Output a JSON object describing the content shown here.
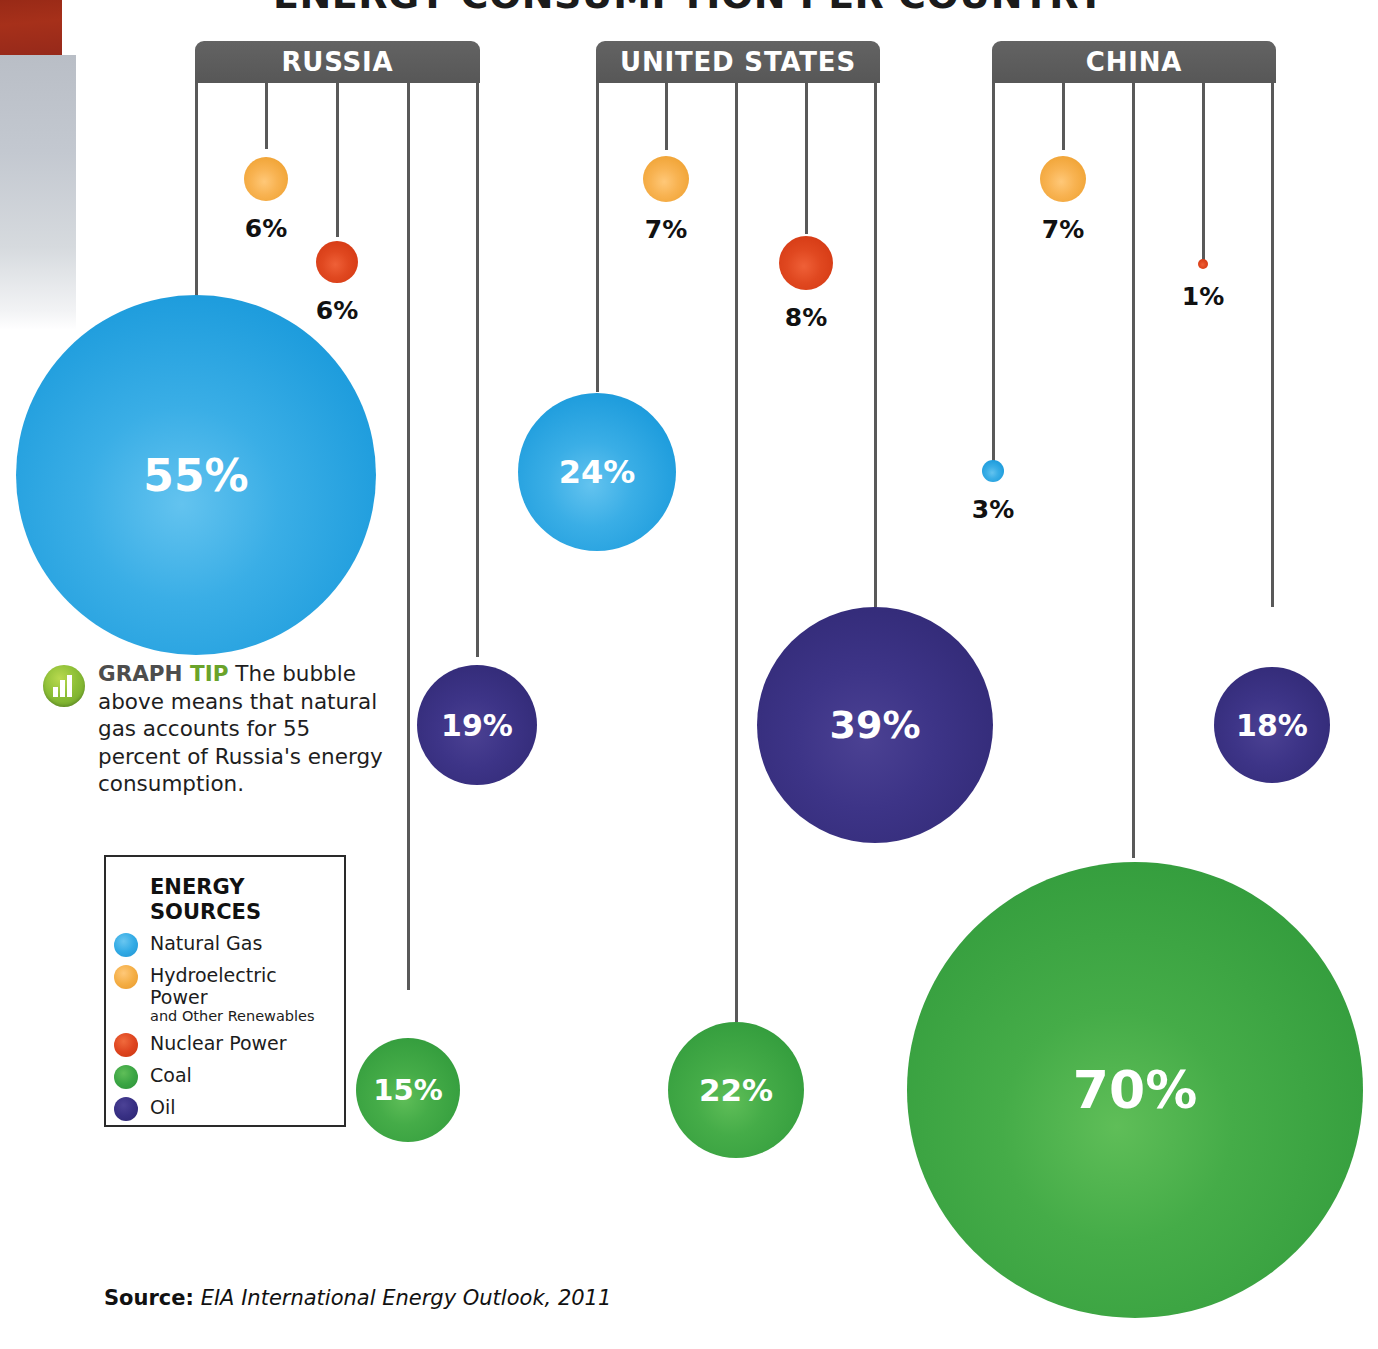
{
  "title": "ENERGY CONSUMPTION PER COUNTRY",
  "source": {
    "label": "Source:",
    "text": "EIA International Energy Outlook, 2011"
  },
  "tip": {
    "icon": "bar-chart-icon",
    "head": "GRAPH",
    "head_accent": "TIP",
    "body": " The bubble above means that natural gas accounts for 55 percent of Russia's energy consumption."
  },
  "legend": {
    "title": "ENERGY\nSOURCES",
    "items": [
      {
        "key": "ng",
        "label": "Natural Gas",
        "sub": "",
        "color": "#2DA5E2"
      },
      {
        "key": "hydro",
        "label": "Hydroelectric Power",
        "sub": "and Other Renewables",
        "color": "#F5A93F"
      },
      {
        "key": "nuclear",
        "label": "Nuclear Power",
        "sub": "",
        "color": "#DD3E18"
      },
      {
        "key": "coal",
        "label": "Coal",
        "sub": "",
        "color": "#39A042"
      },
      {
        "key": "oil",
        "label": "Oil",
        "sub": "",
        "color": "#372F7E"
      }
    ]
  },
  "chart_data": {
    "type": "bubble",
    "title": "ENERGY CONSUMPTION PER COUNTRY",
    "unit": "%",
    "source": "EIA International Energy Outlook, 2011",
    "series": [
      "Natural Gas",
      "Hydroelectric Power and Other Renewables",
      "Nuclear Power",
      "Coal",
      "Oil"
    ],
    "categories": [
      "RUSSIA",
      "UNITED STATES",
      "CHINA"
    ],
    "countries": [
      {
        "name": "RUSSIA",
        "values": [
          {
            "source": "Natural Gas",
            "value": 55,
            "label": "55%"
          },
          {
            "source": "Hydroelectric Power and Other Renewables",
            "value": 6,
            "label": "6%"
          },
          {
            "source": "Nuclear Power",
            "value": 6,
            "label": "6%"
          },
          {
            "source": "Coal",
            "value": 15,
            "label": "15%"
          },
          {
            "source": "Oil",
            "value": 19,
            "label": "19%"
          }
        ]
      },
      {
        "name": "UNITED STATES",
        "values": [
          {
            "source": "Natural Gas",
            "value": 24,
            "label": "24%"
          },
          {
            "source": "Hydroelectric Power and Other Renewables",
            "value": 7,
            "label": "7%"
          },
          {
            "source": "Nuclear Power",
            "value": 8,
            "label": "8%"
          },
          {
            "source": "Coal",
            "value": 22,
            "label": "22%"
          },
          {
            "source": "Oil",
            "value": 39,
            "label": "39%"
          }
        ]
      },
      {
        "name": "CHINA",
        "values": [
          {
            "source": "Natural Gas",
            "value": 3,
            "label": "3%"
          },
          {
            "source": "Hydroelectric Power and Other Renewables",
            "value": 7,
            "label": "7%"
          },
          {
            "source": "Nuclear Power",
            "value": 1,
            "label": "1%"
          },
          {
            "source": "Coal",
            "value": 70,
            "label": "70%"
          },
          {
            "source": "Oil",
            "value": 18,
            "label": "18%"
          }
        ]
      }
    ],
    "colors": {
      "Natural Gas": "#2DA5E2",
      "Hydroelectric Power and Other Renewables": "#F5A93F",
      "Nuclear Power": "#DD3E18",
      "Coal": "#39A042",
      "Oil": "#372F7E"
    }
  },
  "headers": [
    {
      "name": "RUSSIA",
      "left": 195,
      "width": 285
    },
    {
      "name": "UNITED STATES",
      "left": 596,
      "width": 284
    },
    {
      "name": "CHINA",
      "left": 992,
      "width": 284
    }
  ],
  "connectors": [
    {
      "x": 196,
      "top": 82,
      "height": 215
    },
    {
      "x": 266,
      "top": 82,
      "height": 67
    },
    {
      "x": 337,
      "top": 82,
      "height": 155
    },
    {
      "x": 408,
      "top": 82,
      "height": 908
    },
    {
      "x": 477,
      "top": 82,
      "height": 575
    },
    {
      "x": 597,
      "top": 82,
      "height": 310
    },
    {
      "x": 666,
      "top": 82,
      "height": 68
    },
    {
      "x": 736,
      "top": 82,
      "height": 940
    },
    {
      "x": 806,
      "top": 82,
      "height": 152
    },
    {
      "x": 875,
      "top": 82,
      "height": 525
    },
    {
      "x": 993,
      "top": 82,
      "height": 380
    },
    {
      "x": 1063,
      "top": 82,
      "height": 68
    },
    {
      "x": 1133,
      "top": 82,
      "height": 776
    },
    {
      "x": 1203,
      "top": 82,
      "height": 178
    },
    {
      "x": 1272,
      "top": 82,
      "height": 525
    }
  ],
  "bubbles": [
    {
      "key": "ru-ng",
      "cls": "ng",
      "cx": 196,
      "cy": 475,
      "r": 180,
      "label": "55%",
      "fs": 44,
      "inside": true
    },
    {
      "key": "ru-hydro",
      "cls": "hydro",
      "cx": 266,
      "cy": 179,
      "r": 22,
      "label": "6%",
      "fs": 25,
      "inside": false
    },
    {
      "key": "ru-nuclear",
      "cls": "nuclear",
      "cx": 337,
      "cy": 262,
      "r": 21,
      "label": "6%",
      "fs": 25,
      "inside": false
    },
    {
      "key": "ru-coal",
      "cls": "coal",
      "cx": 408,
      "cy": 1090,
      "r": 52,
      "label": "15%",
      "fs": 29,
      "inside": true
    },
    {
      "key": "ru-oil",
      "cls": "oil",
      "cx": 477,
      "cy": 725,
      "r": 60,
      "label": "19%",
      "fs": 30,
      "inside": true
    },
    {
      "key": "us-ng",
      "cls": "ng",
      "cx": 597,
      "cy": 472,
      "r": 79,
      "label": "24%",
      "fs": 32,
      "inside": true
    },
    {
      "key": "us-hydro",
      "cls": "hydro",
      "cx": 666,
      "cy": 179,
      "r": 23,
      "label": "7%",
      "fs": 25,
      "inside": false
    },
    {
      "key": "us-coal",
      "cls": "coal",
      "cx": 736,
      "cy": 1090,
      "r": 68,
      "label": "22%",
      "fs": 31,
      "inside": true
    },
    {
      "key": "us-nuclear",
      "cls": "nuclear",
      "cx": 806,
      "cy": 263,
      "r": 27,
      "label": "8%",
      "fs": 25,
      "inside": false
    },
    {
      "key": "us-oil",
      "cls": "oil",
      "cx": 875,
      "cy": 725,
      "r": 118,
      "label": "39%",
      "fs": 38,
      "inside": true
    },
    {
      "key": "cn-ng",
      "cls": "ng",
      "cx": 993,
      "cy": 471,
      "r": 11,
      "label": "3%",
      "fs": 25,
      "inside": false
    },
    {
      "key": "cn-hydro",
      "cls": "hydro",
      "cx": 1063,
      "cy": 179,
      "r": 23,
      "label": "7%",
      "fs": 25,
      "inside": false
    },
    {
      "key": "cn-coal",
      "cls": "coal",
      "cx": 1135,
      "cy": 1090,
      "r": 228,
      "label": "70%",
      "fs": 52,
      "inside": true
    },
    {
      "key": "cn-nuclear",
      "cls": "nuclear",
      "cx": 1203,
      "cy": 264,
      "r": 5,
      "label": "1%",
      "fs": 25,
      "inside": false
    },
    {
      "key": "cn-oil",
      "cls": "oil",
      "cx": 1272,
      "cy": 725,
      "r": 58,
      "label": "18%",
      "fs": 30,
      "inside": true
    }
  ]
}
